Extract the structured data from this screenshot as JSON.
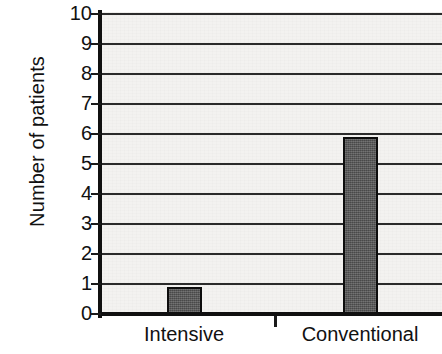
{
  "chart_data": {
    "type": "bar",
    "title": "",
    "subtitle": "",
    "xlabel": "",
    "ylabel": "Number of patients",
    "categories": [
      "Intensive",
      "Conventional"
    ],
    "values": [
      0.9,
      5.9
    ],
    "ylim": [
      0,
      10
    ],
    "yticks": [
      0,
      1,
      2,
      3,
      4,
      5,
      6,
      7,
      8,
      9,
      10
    ],
    "ytick_labels": [
      "0",
      "1",
      "2",
      "3",
      "4",
      "5",
      "6",
      "7",
      "8",
      "9",
      "10"
    ],
    "grid": true,
    "grid_axis": "y",
    "legend": false,
    "legend_position": "none",
    "series": [
      {
        "name": "Number of patients",
        "values": [
          0.9,
          5.9
        ],
        "color": "#575757"
      }
    ],
    "annotations": [],
    "colors": {
      "bar_fill": "#575757",
      "bar_edge": "#0d0d0d",
      "plot_background": "#f3f2f0",
      "gridline": "#2b2b2b",
      "axis": "#101010",
      "text": "#111111"
    }
  },
  "axis": {
    "y_title": "Number of patients"
  }
}
